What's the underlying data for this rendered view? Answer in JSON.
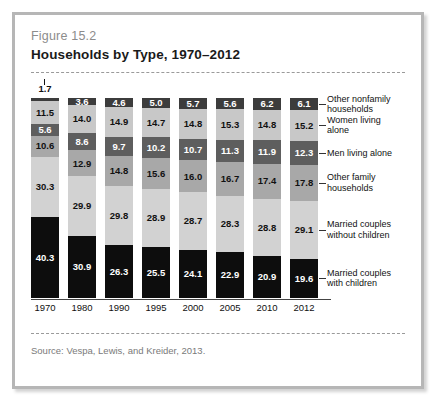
{
  "figure": {
    "number": "Figure 15.2",
    "title": "Households by Type, 1970–2012",
    "source": "Source:  Vespa, Lewis, and Kreider, 2013."
  },
  "chart_data": {
    "type": "bar",
    "stacked": true,
    "normalized_percent": true,
    "title": "Households by Type, 1970–2012",
    "xlabel": "",
    "ylabel": "",
    "ylim": [
      0,
      100
    ],
    "grid": false,
    "legend_position": "right",
    "categories": [
      "1970",
      "1980",
      "1990",
      "1995",
      "2000",
      "2005",
      "2010",
      "2012"
    ],
    "series": [
      {
        "name": "Married couples with children",
        "color": "#0d0d0d",
        "label_color": "#ffffff",
        "values": [
          40.3,
          30.9,
          26.3,
          25.5,
          24.1,
          22.9,
          20.9,
          19.6
        ]
      },
      {
        "name": "Married couples without children",
        "color": "#d2d2d2",
        "label_color": "#111111",
        "values": [
          30.3,
          29.9,
          29.8,
          28.9,
          28.7,
          28.3,
          28.8,
          29.1
        ]
      },
      {
        "name": "Other family households",
        "color": "#a8a8a8",
        "label_color": "#111111",
        "values": [
          10.6,
          12.9,
          14.8,
          15.6,
          16.0,
          16.7,
          17.4,
          17.8
        ]
      },
      {
        "name": "Men living alone",
        "color": "#5e5e5e",
        "label_color": "#ffffff",
        "values": [
          5.6,
          8.6,
          9.7,
          10.2,
          10.7,
          11.3,
          11.9,
          12.3
        ]
      },
      {
        "name": "Women living alone",
        "color": "#c8c8c8",
        "label_color": "#111111",
        "values": [
          11.5,
          14.0,
          14.9,
          14.7,
          14.8,
          15.3,
          14.8,
          15.2
        ]
      },
      {
        "name": "Other nonfamily households",
        "color": "#3c3c3c",
        "label_color": "#ffffff",
        "values": [
          1.7,
          3.6,
          4.6,
          5.0,
          5.7,
          5.6,
          6.2,
          6.1
        ]
      }
    ],
    "annotations": [
      {
        "text": "1.7",
        "for_category": "1970",
        "for_series": "Other nonfamily households",
        "placement": "above-bar"
      }
    ]
  },
  "legend": [
    {
      "label_line1": "Other nonfamily",
      "label_line2": "households"
    },
    {
      "label_line1": "Women living",
      "label_line2": "alone"
    },
    {
      "label_line1": "Men living alone",
      "label_line2": ""
    },
    {
      "label_line1": "Other family",
      "label_line2": "households"
    },
    {
      "label_line1": "Married couples",
      "label_line2": "without children"
    },
    {
      "label_line1": "Married couples",
      "label_line2": "with children"
    }
  ]
}
